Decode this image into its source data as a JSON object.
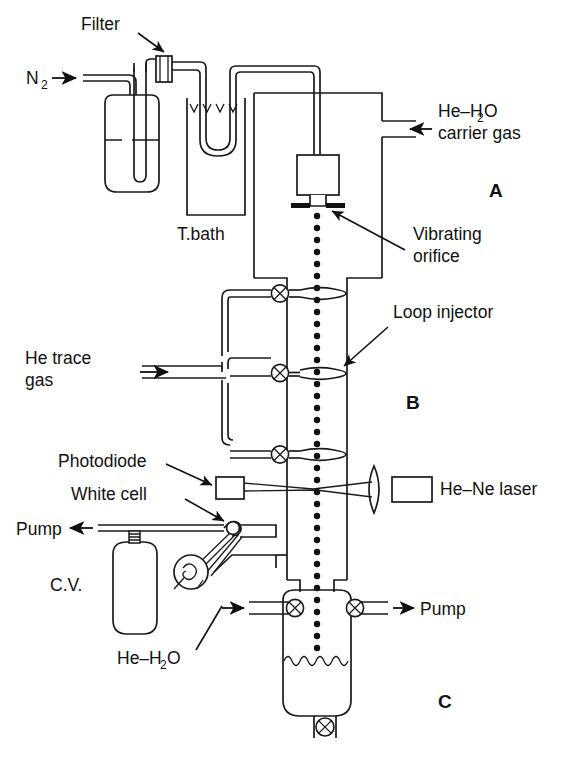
{
  "figure": {
    "type": "schematic-diagram",
    "background_color": "#ffffff",
    "line_color": "#1a1a1a",
    "text_color": "#111111"
  },
  "sections": [
    {
      "id": "A",
      "label": "A",
      "x": 495,
      "y": 196
    },
    {
      "id": "B",
      "label": "B",
      "x": 412,
      "y": 408
    },
    {
      "id": "C",
      "label": "C",
      "x": 444,
      "y": 707
    }
  ],
  "labels": {
    "n2_inlet": "N",
    "n2_inlet_sub": "2",
    "filter": "Filter",
    "t_bath": "T.bath",
    "carrier_gas_line1": "He–H",
    "carrier_gas_sub": "2",
    "carrier_gas_line1_end": "O",
    "carrier_gas_line2": "carrier gas",
    "vibrating_orifice_line1": "Vibrating",
    "vibrating_orifice_line2": "orifice",
    "loop_injector": "Loop injector",
    "he_trace_line1": "He trace",
    "he_trace_line2": "gas",
    "photodiode": "Photodiode",
    "white_cell": "White cell",
    "pump_left": "Pump",
    "cv": "C.V.",
    "he_ne_laser": "He–Ne laser",
    "he_h2o_bottom_a": "He–H",
    "he_h2o_bottom_sub": "2",
    "he_h2o_bottom_b": "O",
    "pump_right": "Pump"
  },
  "components": [
    {
      "name": "nitrogen-inlet-line",
      "kind": "gas-line",
      "label": "N2"
    },
    {
      "name": "filter-cartridge",
      "kind": "inline-filter",
      "label": "Filter"
    },
    {
      "name": "bubbler-flask",
      "kind": "liquid-reservoir"
    },
    {
      "name": "temperature-bath",
      "kind": "thermostatic-bath",
      "label": "T.bath"
    },
    {
      "name": "carrier-gas-inlet",
      "kind": "gas-line",
      "label": "He-H2O carrier gas"
    },
    {
      "name": "droplet-generator",
      "kind": "orifice-housing"
    },
    {
      "name": "vibrating-orifice",
      "kind": "orifice",
      "label": "Vibrating orifice"
    },
    {
      "name": "droplet-train",
      "kind": "droplet-stream",
      "droplet_count": 46
    },
    {
      "name": "loop-injector-1",
      "kind": "loop-injector",
      "label": "Loop injector"
    },
    {
      "name": "loop-injector-2",
      "kind": "loop-injector",
      "label": "Loop injector"
    },
    {
      "name": "loop-injector-3",
      "kind": "loop-injector",
      "label": "Loop injector"
    },
    {
      "name": "he-trace-gas-inlet",
      "kind": "gas-line",
      "label": "He trace gas"
    },
    {
      "name": "photodiode-detector",
      "kind": "detector",
      "label": "Photodiode"
    },
    {
      "name": "focusing-lens",
      "kind": "lens"
    },
    {
      "name": "he-ne-laser",
      "kind": "laser-source",
      "label": "He-Ne laser"
    },
    {
      "name": "white-cell",
      "kind": "optical-cell",
      "label": "White cell"
    },
    {
      "name": "calibration-volume",
      "kind": "gas-cylinder",
      "label": "C.V."
    },
    {
      "name": "pump-outlet-left",
      "kind": "pump-line",
      "label": "Pump"
    },
    {
      "name": "collection-chamber",
      "kind": "collection-vessel"
    },
    {
      "name": "he-h2o-inlet-bottom",
      "kind": "gas-line",
      "label": "He-H2O"
    },
    {
      "name": "pump-outlet-right",
      "kind": "pump-line",
      "label": "Pump"
    },
    {
      "name": "drain-valve",
      "kind": "valve"
    }
  ],
  "valves": [
    {
      "name": "valve-injector-1",
      "x": 280,
      "y": 290
    },
    {
      "name": "valve-injector-2",
      "x": 280,
      "y": 373
    },
    {
      "name": "valve-injector-3",
      "x": 280,
      "y": 455
    },
    {
      "name": "valve-cv",
      "x": 98,
      "y": 549
    },
    {
      "name": "valve-chamber-inlet",
      "x": 295,
      "y": 608
    },
    {
      "name": "valve-chamber-outlet",
      "x": 355,
      "y": 608
    },
    {
      "name": "valve-drain",
      "x": 325,
      "y": 727
    }
  ]
}
